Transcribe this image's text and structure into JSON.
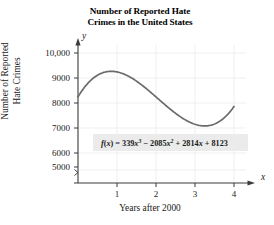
{
  "chart_data": {
    "type": "line",
    "title": "Number of Reported Hate Crimes in the United States",
    "title_lines": [
      "Number of Reported Hate",
      "Crimes in the United States"
    ],
    "xlabel": "Years after 2000",
    "ylabel": "Number of Reported Hate Crimes",
    "ylabel_lines": [
      "Number of Reported",
      "Hate Crimes"
    ],
    "x_axis_letter": "x",
    "y_axis_letter": "y",
    "xlim": [
      0,
      4.25
    ],
    "ylim": [
      5000,
      10400
    ],
    "y_axis_break": true,
    "grid": true,
    "legend": "none",
    "xticks": [
      1,
      2,
      3,
      4
    ],
    "xtick_labels": [
      "1",
      "2",
      "3",
      "4"
    ],
    "yticks": [
      5000,
      6000,
      7000,
      8000,
      9000,
      10000
    ],
    "ytick_labels": [
      "5000",
      "6000",
      "7000",
      "8000",
      "9000",
      "10,000"
    ],
    "equation": {
      "lhs": "f(x)",
      "equals": "=",
      "terms": [
        {
          "coef": "339",
          "var": "x",
          "power": "3",
          "sign": ""
        },
        {
          "coef": "2085",
          "var": "x",
          "power": "2",
          "sign": "−"
        },
        {
          "coef": "2814",
          "var": "x",
          "power": "",
          "sign": "+"
        },
        {
          "coef": "8123",
          "var": "",
          "power": "",
          "sign": "+"
        }
      ],
      "plain": "f(x) = 339x³ − 2085x² + 2814x + 8123",
      "coefficients": [
        339,
        -2085,
        2814,
        8123
      ],
      "box_fill": "#ebebeb"
    },
    "curve": {
      "name": "f(x)",
      "color": "#6b6b6b",
      "x": [
        0,
        0.2,
        0.4,
        0.6,
        0.8,
        1.0,
        1.2,
        1.4,
        1.6,
        1.8,
        2.0,
        2.2,
        2.4,
        2.6,
        2.8,
        3.0,
        3.2,
        3.4,
        3.6,
        3.8,
        4.0
      ],
      "y": [
        8123,
        8605,
        8936,
        9131,
        9205,
        9191,
        9086,
        8927,
        8731,
        8516,
        8299,
        8097,
        7927,
        7807,
        7754,
        7785,
        7917,
        8168,
        8554,
        9093,
        9803
      ]
    },
    "colors": {
      "axis": "#3b3b3b",
      "grid": "#e6e6e6",
      "curve": "#6b6b6b",
      "text": "#1a1a1a",
      "equation_box": "#ebebeb"
    }
  }
}
